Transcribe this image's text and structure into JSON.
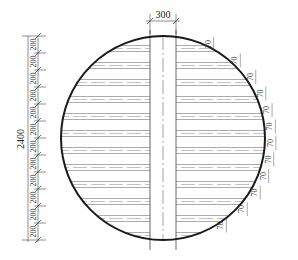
{
  "drawing": {
    "type": "circular cross-section with horizontal strips and central vertical band",
    "circle": {
      "cx": 163,
      "cy": 138,
      "r": 103,
      "stroke": "#1a1a1a"
    },
    "central_band": {
      "label": "300",
      "x_left": 150,
      "x_right": 176,
      "center_x": 163
    },
    "overall_height_dimension": {
      "label": "2400"
    },
    "left_dimension_chain": {
      "segment_labels": [
        "200",
        "200",
        "200",
        "200",
        "200",
        "200",
        "200",
        "200",
        "200",
        "200",
        "200",
        "200"
      ],
      "top_y": 36,
      "bottom_y": 240
    },
    "right_arc_labels": [
      "70",
      "70",
      "70",
      "70",
      "70",
      "70",
      "70",
      "70",
      "70",
      "70",
      "70",
      "70"
    ],
    "strip_rows_count": 12,
    "line_color": "#888888",
    "dash_color": "#999999"
  }
}
